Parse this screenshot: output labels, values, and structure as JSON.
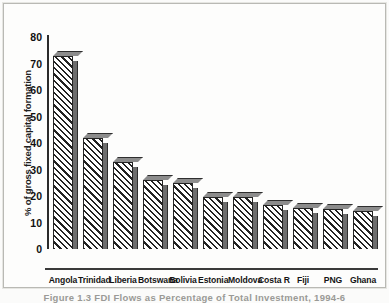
{
  "chart_data": {
    "type": "bar",
    "title": "",
    "xlabel": "",
    "ylabel": "% of gross fixed capital formation",
    "ylim": [
      0,
      80
    ],
    "yticks": [
      80,
      70,
      60,
      50,
      40,
      30,
      20,
      10,
      0
    ],
    "grid": false,
    "legend": null,
    "categories": [
      "Angola",
      "Trinidad",
      "Liberia",
      "Botswana",
      "Bolivia",
      "Estonia",
      "Moldova",
      "Costa R",
      "Fiji",
      "PNG",
      "Ghana"
    ],
    "values": [
      73,
      42,
      33,
      26,
      25,
      19.5,
      19.5,
      16.5,
      15.5,
      15,
      14.5
    ]
  },
  "figure": {
    "caption": "Figure 1.3   FDI Flows as Percentage of Total Investment, 1994-6",
    "style": {
      "bar_fill": "#ffffff",
      "bar_hatch": "#222222",
      "bar_side": "#6d6d6d",
      "bar_outline": "#232323",
      "axis": "#2b2b2b",
      "background": "#fdfdfc",
      "frame": "#b9b9b4"
    }
  }
}
